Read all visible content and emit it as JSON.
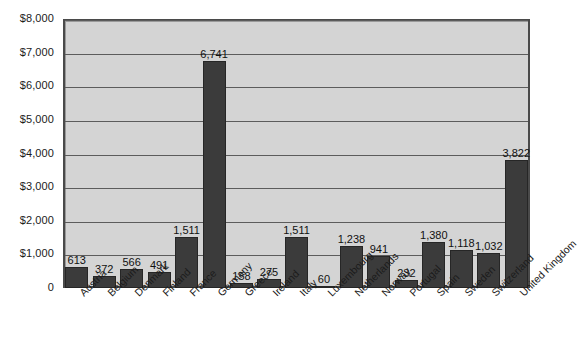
{
  "chart_data": {
    "type": "bar",
    "title": "",
    "subtitle": "",
    "xlabel": "",
    "ylabel": "",
    "ylim": [
      0,
      8000
    ],
    "ytick_step": 1000,
    "grid": true,
    "legend": "none",
    "value_labels": true,
    "currency_prefix": "$",
    "categories": [
      "Austria",
      "Belgium",
      "Denmark",
      "Finland",
      "France",
      "Germany",
      "Greece",
      "Ireland",
      "Italy",
      "Luxembourg",
      "Netherlands",
      "Norway",
      "Portugal",
      "Spain",
      "Sweden",
      "Switzerland",
      "United Kingdom"
    ],
    "values": [
      613,
      372,
      566,
      491,
      1511,
      6741,
      158,
      275,
      1511,
      60,
      1238,
      941,
      232,
      1380,
      1118,
      1032,
      3822
    ],
    "value_labels_text": [
      "613",
      "372",
      "566",
      "491",
      "1,511",
      "6,741",
      "158",
      "275",
      "1,511",
      "60",
      "1,238",
      "941",
      "232",
      "1,380",
      "1,118",
      "1,032",
      "3,822"
    ],
    "ytick_labels": [
      "0",
      "$1,000",
      "$2,000",
      "$3,000",
      "$4,000",
      "$5,000",
      "$6,000",
      "$7,000",
      "$8,000"
    ],
    "ytick_values": [
      0,
      1000,
      2000,
      3000,
      4000,
      5000,
      6000,
      7000,
      8000
    ],
    "colors": {
      "bar_fill": "#3b3b3b",
      "bar_border": "#262626",
      "plot_background": "#d4d4d4",
      "plot_border": "#4a4a4a",
      "gridline": "#5c5c5c",
      "page_background": "#ffffff",
      "text": "#1b1b1b"
    }
  }
}
